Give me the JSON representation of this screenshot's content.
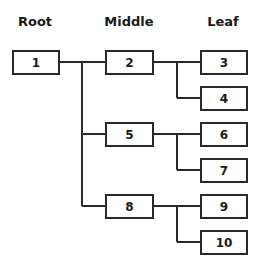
{
  "headers": {
    "root": "Root",
    "middle": "Middle",
    "leaf": "Leaf"
  },
  "nodes": {
    "n1": "1",
    "n2": "2",
    "n3": "3",
    "n4": "4",
    "n5": "5",
    "n6": "6",
    "n7": "7",
    "n8": "8",
    "n9": "9",
    "n10": "10"
  },
  "tree": {
    "root": "1",
    "children": [
      {
        "node": "2",
        "children": [
          "3",
          "4"
        ]
      },
      {
        "node": "5",
        "children": [
          "6",
          "7"
        ]
      },
      {
        "node": "8",
        "children": [
          "9",
          "10"
        ]
      }
    ]
  },
  "colors": {
    "stroke": "#2a2a2a",
    "text": "#1a1a1a",
    "background": "#ffffff"
  }
}
